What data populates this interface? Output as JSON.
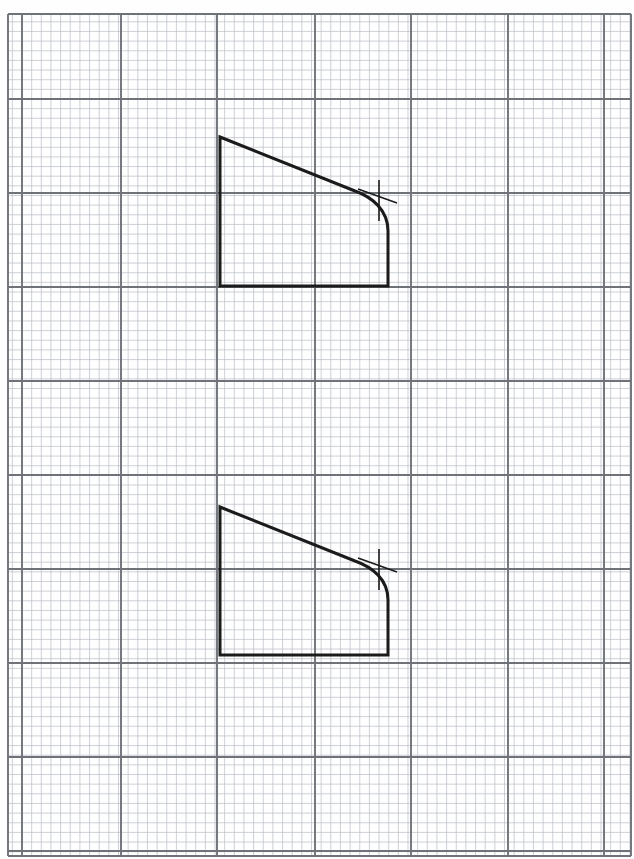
{
  "document": {
    "title": "Graph paper technical drawing",
    "description": "Two identical line-drawn profile outlines on engineering graph paper, each with a tangent construction cross mark at the fillet tangency point",
    "page": {
      "width": 634,
      "height": 859,
      "background": "#fefefe"
    }
  },
  "grid": {
    "name": "engineering-graph-paper",
    "minor": {
      "label": "minor grid",
      "spacing_px": 9.65,
      "color": "#b9bdc5",
      "width_px": 0.7
    },
    "major": {
      "label": "major grid",
      "every_n_minor": 5,
      "color": "#6f7379",
      "width_px": 1.9
    },
    "area": {
      "x0": 8,
      "y0": 14,
      "x1": 631,
      "y1": 856
    },
    "major_x": [
      22,
      121,
      217,
      315,
      411,
      508,
      604
    ],
    "major_y": [
      99,
      193,
      287,
      381,
      475,
      569,
      663,
      757,
      851
    ]
  },
  "drawing": {
    "stroke_color": "#1b1b1b",
    "stroke_width_px": 3.0,
    "mark_color": "#1b1b1b",
    "mark_width_px": 1.6,
    "shapes": [
      {
        "name": "upper-profile",
        "label": "Upper profile outline",
        "top_left": [
          220,
          137
        ],
        "top_right_tangent": [
          355,
          191
        ],
        "fillet_end": [
          388,
          231
        ],
        "bottom_right": [
          388,
          286
        ],
        "bottom_left": [
          220,
          286
        ],
        "fillet_control": [
          380,
          194
        ],
        "path": "M 220 137 L 355 191 C 372 197 388 210 388 231 L 388 286 L 220 286 Z",
        "tangent_mark": {
          "name": "tangent-cross-upper",
          "vertical": [
            379,
            180,
            379,
            221
          ],
          "slant": [
            358,
            189,
            397,
            203
          ]
        }
      },
      {
        "name": "lower-profile",
        "label": "Lower profile outline",
        "top_left": [
          220,
          507
        ],
        "top_right_tangent": [
          355,
          561
        ],
        "fillet_end": [
          388,
          600
        ],
        "bottom_right": [
          388,
          655
        ],
        "bottom_left": [
          220,
          655
        ],
        "fillet_control": [
          380,
          563
        ],
        "path": "M 220 507 L 355 561 C 372 567 388 579 388 600 L 388 655 L 220 655 Z",
        "tangent_mark": {
          "name": "tangent-cross-lower",
          "vertical": [
            379,
            549,
            379,
            590
          ],
          "slant": [
            358,
            558,
            397,
            572
          ]
        }
      }
    ]
  }
}
